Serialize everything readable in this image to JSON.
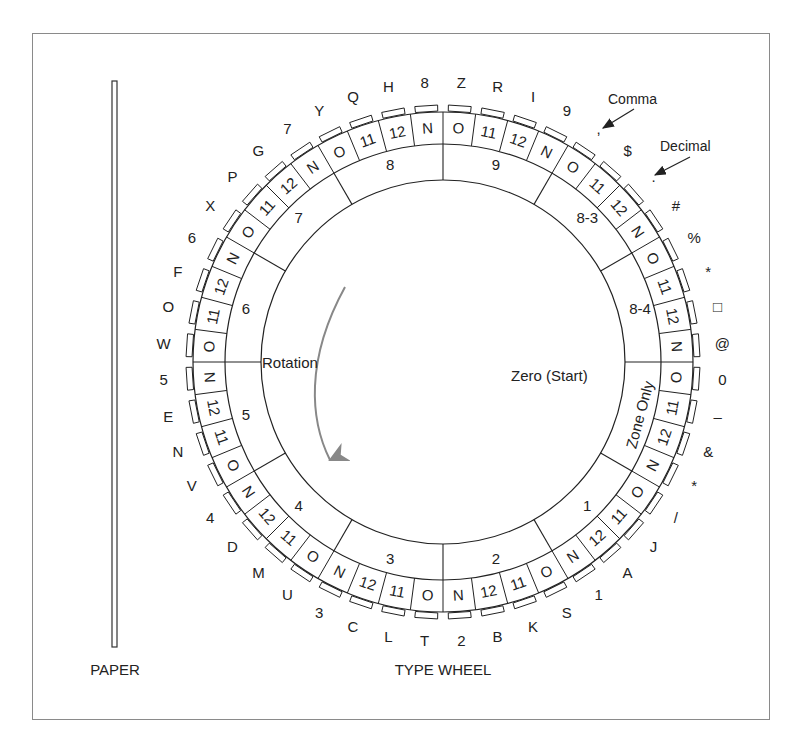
{
  "figure": {
    "paper_label": "PAPER",
    "wheel_label": "TYPE WHEEL",
    "rotation_label": "Rotation",
    "zero_label": "Zero (Start)",
    "callouts": [
      {
        "label": "Comma"
      },
      {
        "label": "Decimal"
      }
    ],
    "sectors": [
      "9",
      "8-3",
      "8-4",
      "Zone Only",
      "1",
      "2",
      "3",
      "4",
      "5",
      "6",
      "7",
      "8"
    ],
    "cells": [
      {
        "zone": "O",
        "char": "Z"
      },
      {
        "zone": "11",
        "char": "R"
      },
      {
        "zone": "12",
        "char": "I"
      },
      {
        "zone": "N",
        "char": "9"
      },
      {
        "zone": "O",
        "char": ","
      },
      {
        "zone": "11",
        "char": "$"
      },
      {
        "zone": "12",
        "char": "."
      },
      {
        "zone": "N",
        "char": "#"
      },
      {
        "zone": "O",
        "char": "%"
      },
      {
        "zone": "11",
        "char": "*"
      },
      {
        "zone": "12",
        "char": "□"
      },
      {
        "zone": "N",
        "char": "@"
      },
      {
        "zone": "O",
        "char": "0"
      },
      {
        "zone": "11",
        "char": "–"
      },
      {
        "zone": "12",
        "char": "&"
      },
      {
        "zone": "N",
        "char": "*"
      },
      {
        "zone": "O",
        "char": "/"
      },
      {
        "zone": "11",
        "char": "J"
      },
      {
        "zone": "12",
        "char": "A"
      },
      {
        "zone": "N",
        "char": "1"
      },
      {
        "zone": "O",
        "char": "S"
      },
      {
        "zone": "11",
        "char": "K"
      },
      {
        "zone": "12",
        "char": "B"
      },
      {
        "zone": "N",
        "char": "2"
      },
      {
        "zone": "O",
        "char": "T"
      },
      {
        "zone": "11",
        "char": "L"
      },
      {
        "zone": "12",
        "char": "C"
      },
      {
        "zone": "N",
        "char": "3"
      },
      {
        "zone": "O",
        "char": "U"
      },
      {
        "zone": "11",
        "char": "M"
      },
      {
        "zone": "12",
        "char": "D"
      },
      {
        "zone": "N",
        "char": "4"
      },
      {
        "zone": "O",
        "char": "V"
      },
      {
        "zone": "11",
        "char": "N"
      },
      {
        "zone": "12",
        "char": "E"
      },
      {
        "zone": "N",
        "char": "5"
      },
      {
        "zone": "O",
        "char": "W"
      },
      {
        "zone": "11",
        "char": "O"
      },
      {
        "zone": "12",
        "char": "F"
      },
      {
        "zone": "N",
        "char": "6"
      },
      {
        "zone": "O",
        "char": "X"
      },
      {
        "zone": "11",
        "char": "P"
      },
      {
        "zone": "12",
        "char": "G"
      },
      {
        "zone": "N",
        "char": "7"
      },
      {
        "zone": "O",
        "char": "Y"
      },
      {
        "zone": "11",
        "char": "Q"
      },
      {
        "zone": "12",
        "char": "H"
      },
      {
        "zone": "N",
        "char": "8"
      }
    ]
  }
}
